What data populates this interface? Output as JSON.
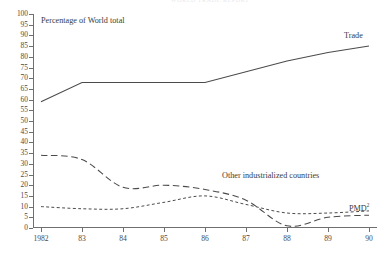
{
  "running_head": "WORLD  TRADE  REPORT",
  "axis_note": "Percentage of World total",
  "labels": {
    "trade": "Trade",
    "other": "Other industrialized countries",
    "pmd": "PMD",
    "pmd_footnote": "2"
  },
  "chart_data": {
    "type": "line",
    "title": "",
    "subtitle": "Percentage of World total",
    "xlabel": "",
    "ylabel": "Percentage of World total",
    "x": [
      "1982",
      "83",
      "84",
      "85",
      "86",
      "87",
      "88",
      "89",
      "90"
    ],
    "categories": [
      "1982",
      "83",
      "84",
      "85",
      "86",
      "87",
      "88",
      "89",
      "90"
    ],
    "xticklabels": [
      "1982",
      "83",
      "84",
      "85",
      "86",
      "87",
      "88",
      "89",
      "90"
    ],
    "yticklabels": [
      "0",
      "5",
      "10",
      "15",
      "20",
      "25",
      "30",
      "35",
      "40",
      "45",
      "50",
      "55",
      "60",
      "65",
      "70",
      "75",
      "80",
      "85",
      "90",
      "95",
      "100"
    ],
    "ylim": [
      0,
      100
    ],
    "ytick_step": 5,
    "grid": false,
    "legend": "inline-annotations",
    "series": [
      {
        "name": "Trade",
        "style": "solid",
        "color": "#4b4b4b",
        "values": [
          59,
          68,
          68,
          68,
          68,
          73,
          78,
          82,
          85
        ]
      },
      {
        "name": "Other industrialized countries",
        "style": "long-dashed",
        "color": "#4b4b4b",
        "values": [
          34,
          32,
          19,
          20,
          18,
          13,
          1,
          5,
          6
        ]
      },
      {
        "name": "PMD",
        "style": "short-dashed",
        "color": "#4b4b4b",
        "values": [
          10,
          9,
          9,
          12,
          15,
          11,
          7,
          7,
          8
        ]
      }
    ]
  }
}
